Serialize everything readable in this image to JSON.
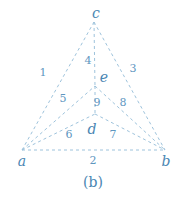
{
  "figure": {
    "caption": "(b)",
    "colors": {
      "edge": "#9ec3dc",
      "vertex_label": "#4a86b3",
      "edge_label": "#5e96bf"
    },
    "vertices": [
      {
        "id": "c",
        "label": "c",
        "x": 94,
        "y": 22,
        "lx": 96,
        "ly": 18
      },
      {
        "id": "e",
        "label": "e",
        "x": 95,
        "y": 86,
        "lx": 104,
        "ly": 82
      },
      {
        "id": "d",
        "label": "d",
        "x": 95,
        "y": 114,
        "lx": 92,
        "ly": 134
      },
      {
        "id": "a",
        "label": "a",
        "x": 22,
        "y": 150,
        "lx": 22,
        "ly": 166
      },
      {
        "id": "b",
        "label": "b",
        "x": 165,
        "y": 150,
        "lx": 166,
        "ly": 166
      }
    ],
    "edges": [
      {
        "label": "1",
        "from": "a",
        "to": "c",
        "lx": 43,
        "ly": 76
      },
      {
        "label": "2",
        "from": "a",
        "to": "b",
        "lx": 93,
        "ly": 164
      },
      {
        "label": "3",
        "from": "c",
        "to": "b",
        "lx": 133,
        "ly": 72
      },
      {
        "label": "4",
        "from": "c",
        "to": "e",
        "lx": 88,
        "ly": 64
      },
      {
        "label": "5",
        "from": "a",
        "to": "e",
        "lx": 63,
        "ly": 102
      },
      {
        "label": "6",
        "from": "a",
        "to": "d",
        "lx": 69,
        "ly": 138
      },
      {
        "label": "7",
        "from": "d",
        "to": "b",
        "lx": 113,
        "ly": 138
      },
      {
        "label": "8",
        "from": "e",
        "to": "b",
        "lx": 123,
        "ly": 106
      },
      {
        "label": "9",
        "from": "e",
        "to": "d",
        "lx": 97,
        "ly": 106
      }
    ]
  }
}
